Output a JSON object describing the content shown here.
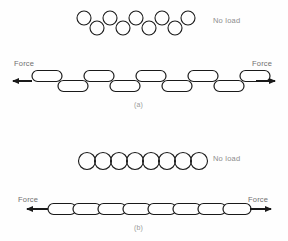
{
  "figure": {
    "stroke_color": "#1a1a1a",
    "text_color": "#8d8d8d",
    "background": "#ffffff"
  },
  "panels": [
    {
      "id": "a",
      "caption": "(a)",
      "no_load_label": "No load",
      "force_left_label": "Force",
      "force_right_label": "Force",
      "unloaded": {
        "shape": "circle",
        "arrangement": "staggered-zigzag",
        "count": 9,
        "diameter": 14,
        "stagger_offset": 5,
        "start_x": 84,
        "spacing": 13,
        "center_y": 23
      },
      "loaded": {
        "shape": "oval-link",
        "arrangement": "staggered-zigzag",
        "count": 9,
        "link_width": 30,
        "link_height": 11,
        "stagger_offset": 5,
        "start_x": 32,
        "spacing": 26,
        "center_y": 81
      },
      "arrows": {
        "left": {
          "from_x": 32,
          "to_x": 8,
          "y": 81
        },
        "right": {
          "from_x": 256,
          "to_x": 280,
          "y": 81
        }
      }
    },
    {
      "id": "b",
      "caption": "(b)",
      "no_load_label": "No load",
      "force_left_label": "Force",
      "force_right_label": "Force",
      "unloaded": {
        "shape": "circle",
        "arrangement": "aligned-row",
        "count": 8,
        "diameter": 17,
        "stagger_offset": 0,
        "start_x": 87,
        "spacing": 16,
        "center_y": 161
      },
      "loaded": {
        "shape": "oval-link",
        "arrangement": "aligned-row",
        "count": 8,
        "link_width": 28,
        "link_height": 11,
        "stagger_offset": 0,
        "start_x": 48,
        "spacing": 25,
        "center_y": 209
      },
      "arrows": {
        "left": {
          "from_x": 48,
          "to_x": 22,
          "y": 209
        },
        "right": {
          "from_x": 250,
          "to_x": 276,
          "y": 209
        }
      }
    }
  ]
}
